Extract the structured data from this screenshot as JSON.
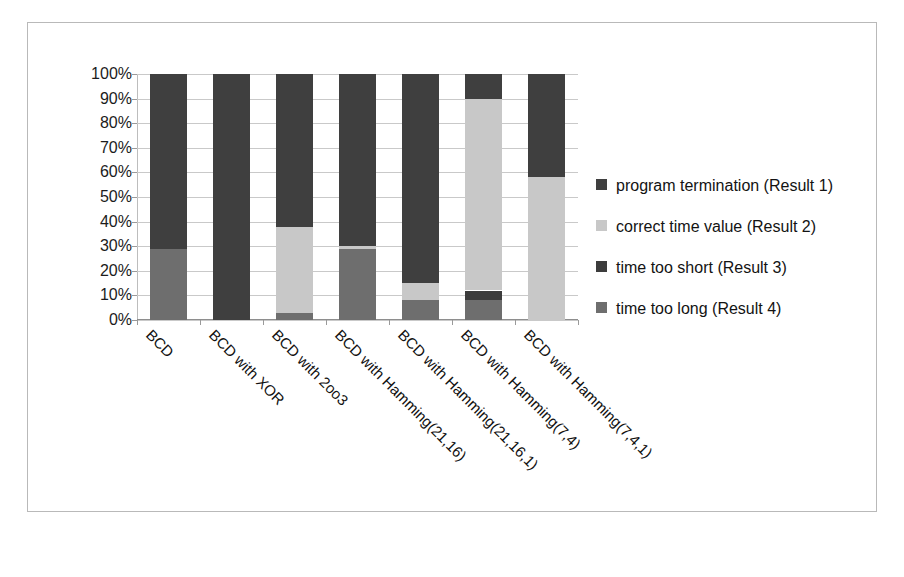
{
  "chart_data": {
    "type": "bar",
    "subtype": "stacked-percent",
    "title": "",
    "xlabel": "",
    "ylabel": "",
    "ylim": [
      0,
      100
    ],
    "ytick_labels": [
      "100%",
      "90%",
      "80%",
      "70%",
      "60%",
      "50%",
      "40%",
      "30%",
      "20%",
      "10%",
      "0%"
    ],
    "ytick_values": [
      100,
      90,
      80,
      70,
      60,
      50,
      40,
      30,
      20,
      10,
      0
    ],
    "grid": true,
    "legend_position": "right",
    "categories": [
      "BCD",
      "BCD with XOR",
      "BCD with 2oo3",
      "BCD with Hamming(21,16)",
      "BCD with Hamming(21,16,1)",
      "BCD with Hamming(7,4)",
      "BCD with Hamming(7,4,1)"
    ],
    "series": [
      {
        "name": "program termination (Result 1)",
        "color": "#3f3f3f",
        "values": [
          71,
          100,
          62,
          70,
          85,
          10,
          42
        ]
      },
      {
        "name": "correct time value (Result 2)",
        "color": "#c8c8c8",
        "values": [
          0,
          0,
          35,
          1,
          7,
          78,
          58
        ]
      },
      {
        "name": "time too short (Result 3)",
        "color": "#3c3c3c",
        "values": [
          0,
          0,
          0,
          0,
          0,
          4,
          0
        ]
      },
      {
        "name": "time too long (Result 4)",
        "color": "#6e6e6e",
        "values": [
          29,
          0,
          3,
          29,
          8,
          8,
          0
        ]
      }
    ]
  },
  "legend": {
    "items": [
      {
        "label": "program termination (Result 1)",
        "color": "#3f3f3f"
      },
      {
        "label": "correct time value (Result 2)",
        "color": "#c8c8c8"
      },
      {
        "label": "time too short (Result 3)",
        "color": "#3c3c3c"
      },
      {
        "label": "time too long (Result 4)",
        "color": "#6e6e6e"
      }
    ]
  }
}
